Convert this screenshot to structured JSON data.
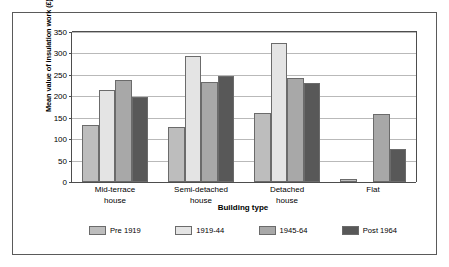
{
  "chart_data": {
    "type": "bar",
    "title": "",
    "xlabel": "Building type",
    "ylabel": "Mean value of insulation work (£)",
    "ylim": [
      0,
      350
    ],
    "ytick_step": 50,
    "yticks": [
      0,
      50,
      100,
      150,
      200,
      250,
      300,
      350
    ],
    "grid": true,
    "legend_position": "bottom",
    "categories": [
      "Mid-terrace house",
      "Semi-detached house",
      "Detached house",
      "Flat"
    ],
    "category_lines": [
      [
        "Mid-terrace",
        "house"
      ],
      [
        "Semi-detached",
        "house"
      ],
      [
        "Detached",
        "house"
      ],
      [
        "Flat",
        ""
      ]
    ],
    "series": [
      {
        "name": "Pre 1919",
        "color": "#bdbdbd",
        "values": [
          132,
          129,
          161,
          8
        ]
      },
      {
        "name": "1919-44",
        "color": "#e4e4e4",
        "values": [
          215,
          294,
          324,
          0
        ]
      },
      {
        "name": "1945-64",
        "color": "#a8a8a8",
        "values": [
          239,
          234,
          243,
          158
        ]
      },
      {
        "name": "Post 1964",
        "color": "#585858",
        "values": [
          198,
          248,
          231,
          78
        ]
      }
    ]
  },
  "figure": {
    "frame_color": "#5a5a5a",
    "axis_color": "#4d4d4d",
    "gridline_color": "#b9b9b9",
    "background": "#ffffff"
  }
}
